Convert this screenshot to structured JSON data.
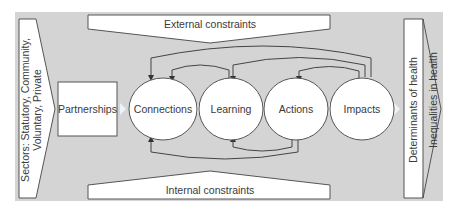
{
  "diagram": {
    "colors": {
      "background": "#d4d4d4",
      "panel_fill": "#ffffff",
      "stroke": "#555555",
      "connector": "#f2f2f2",
      "text": "#3a3a3a"
    },
    "sectors": {
      "line1": "Sectors: Statutory, Community,",
      "line2": "Voluntary, Private"
    },
    "external_constraints": "External constraints",
    "internal_constraints": "Internal constraints",
    "partnerships": "Partnerships",
    "nodes": [
      {
        "id": "connections",
        "label": "Connections"
      },
      {
        "id": "learning",
        "label": "Learning"
      },
      {
        "id": "actions",
        "label": "Actions"
      },
      {
        "id": "impacts",
        "label": "Impacts"
      }
    ],
    "determinants": "Determinants of health",
    "inequalities": "Inequalities in health",
    "feedback_loops": [
      {
        "from": "learning",
        "to": "connections",
        "side": "top"
      },
      {
        "from": "impacts",
        "to": "connections",
        "side": "top"
      },
      {
        "from": "impacts",
        "to": "learning",
        "side": "top"
      },
      {
        "from": "impacts",
        "to": "actions",
        "side": "top"
      },
      {
        "from": "actions",
        "to": "learning",
        "side": "bottom"
      },
      {
        "from": "actions",
        "to": "connections",
        "side": "bottom"
      }
    ]
  }
}
